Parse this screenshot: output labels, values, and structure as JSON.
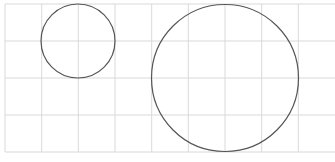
{
  "diagram": {
    "width": 335,
    "height": 162,
    "background": "#ffffff",
    "grid": {
      "color": "#d9d9d9",
      "stroke_width": 1,
      "vertical_lines_x": [
        5,
        41.7,
        78.3,
        115,
        151.7,
        188.3,
        225,
        261.7,
        298.3
      ],
      "horizontal_lines_y": [
        4,
        41,
        78,
        115,
        152
      ]
    },
    "circles": [
      {
        "id": "small-circle",
        "cx": 78,
        "cy": 41,
        "r": 37,
        "stroke": "#555555",
        "stroke_width": 1.2
      },
      {
        "id": "large-circle",
        "cx": 225,
        "cy": 78,
        "r": 73.5,
        "stroke": "#555555",
        "stroke_width": 1.2
      }
    ]
  }
}
